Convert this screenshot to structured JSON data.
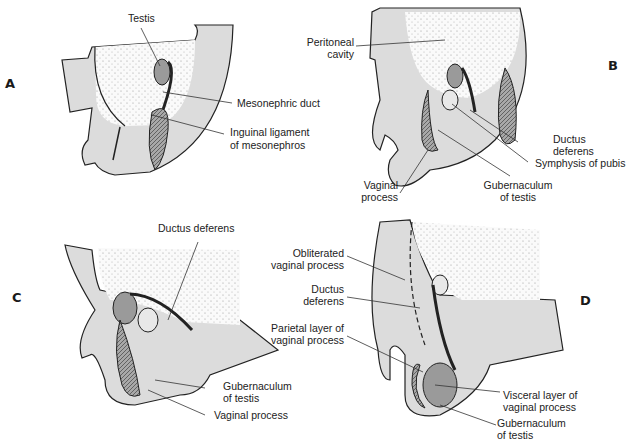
{
  "figure": {
    "colors": {
      "tissue": "#dcdcdc",
      "testis": "#9a9a9a",
      "outline": "#222222",
      "stipple": "#bbbbbb"
    },
    "panels": [
      {
        "id": "A",
        "labels": [
          "Testis",
          "Mesonephric duct",
          "Inguinal ligament",
          "of mesonephros"
        ]
      },
      {
        "id": "B",
        "labels": [
          "Peritoneal",
          "cavity",
          "Ductus",
          "deferens",
          "Symphysis of pubis",
          "Vaginal",
          "process",
          "Gubernaculum",
          "of testis"
        ]
      },
      {
        "id": "C",
        "labels": [
          "Ductus deferens",
          "Gubernaculum",
          "of testis",
          "Vaginal process"
        ]
      },
      {
        "id": "D",
        "labels": [
          "Obliterated",
          "vaginal process",
          "Ductus",
          "deferens",
          "Parietal layer of",
          "vaginal process",
          "Visceral layer of",
          "vaginal process",
          "Gubernaculum",
          "of testis"
        ]
      }
    ]
  },
  "panelA": {
    "letter": "A",
    "testis": "Testis",
    "meso_duct": "Mesonephric duct",
    "ing_lig_1": "Inguinal ligament",
    "ing_lig_2": "of mesonephros"
  },
  "panelB": {
    "letter": "B",
    "perit_1": "Peritoneal",
    "perit_2": "cavity",
    "ductus_1": "Ductus",
    "ductus_2": "deferens",
    "symph": "Symphysis of pubis",
    "vag_1": "Vaginal",
    "vag_2": "process",
    "gub_1": "Gubernaculum",
    "gub_2": "of testis"
  },
  "panelC": {
    "letter": "C",
    "ductus": "Ductus deferens",
    "gub_1": "Gubernaculum",
    "gub_2": "of testis",
    "vag": "Vaginal process"
  },
  "panelD": {
    "letter": "D",
    "oblit_1": "Obliterated",
    "oblit_2": "vaginal process",
    "ductus_1": "Ductus",
    "ductus_2": "deferens",
    "pariet_1": "Parietal layer of",
    "pariet_2": "vaginal process",
    "visc_1": "Visceral layer of",
    "visc_2": "vaginal process",
    "gub_1": "Gubernaculum",
    "gub_2": "of testis"
  }
}
